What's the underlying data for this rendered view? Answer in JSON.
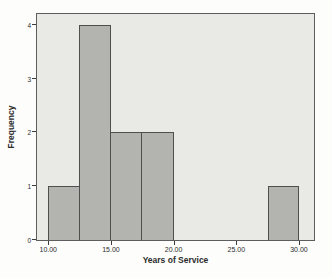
{
  "chart_data": {
    "type": "bar",
    "subtype": "histogram",
    "title": "",
    "xlabel": "Years of Service",
    "ylabel": "Frequency",
    "bins": [
      {
        "x0": 10.0,
        "x1": 12.5,
        "count": 1
      },
      {
        "x0": 12.5,
        "x1": 15.0,
        "count": 4
      },
      {
        "x0": 15.0,
        "x1": 17.5,
        "count": 2
      },
      {
        "x0": 17.5,
        "x1": 20.0,
        "count": 2
      },
      {
        "x0": 27.5,
        "x1": 30.0,
        "count": 1
      }
    ],
    "x_ticks": [
      "10.00",
      "15.00",
      "20.00",
      "25.00",
      "30.00"
    ],
    "x_tick_values": [
      10,
      15,
      20,
      25,
      30
    ],
    "y_ticks": [
      "0",
      "1",
      "2",
      "3",
      "4"
    ],
    "y_tick_values": [
      0,
      1,
      2,
      3,
      4
    ],
    "xlim": [
      9.1,
      31.2
    ],
    "ylim": [
      0,
      4.2
    ],
    "grid": false,
    "legend": null,
    "colors": {
      "page_bg": "#fdfdfb",
      "plot_bg": "#e9e9e6",
      "plot_border": "#5e5e5e",
      "bar_fill": "#b3b3b0",
      "bar_border": "#4f4f4f",
      "tick_color": "#3c3c3c",
      "text": "#2b2b2b"
    }
  }
}
